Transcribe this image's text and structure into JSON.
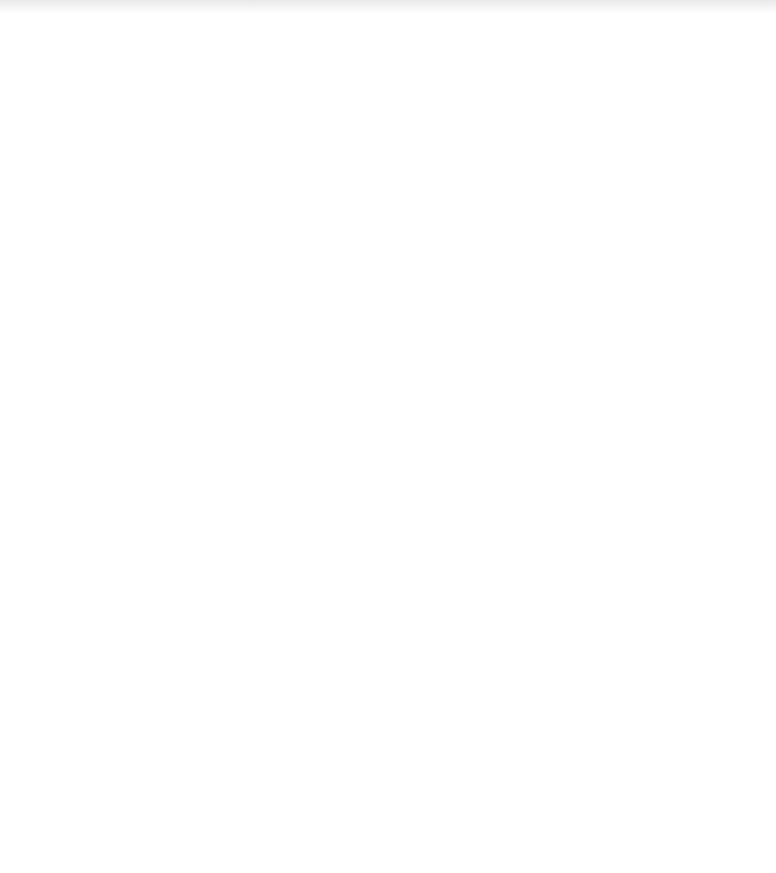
{
  "colors": {
    "background": "#ffffff",
    "wall": "#000000",
    "ray_light": "#8a8a8a",
    "ray_dark": "#1a1a1a",
    "divider": "#555555"
  },
  "figures": {
    "left_corner": {
      "walls": [
        {
          "x1": 41,
          "y1": 60,
          "x2": 41,
          "y2": 397
        },
        {
          "x1": 38,
          "y1": 397,
          "x2": 383,
          "y2": 397
        },
        {
          "x1": 137,
          "y1": 60,
          "x2": 137,
          "y2": 300.5
        },
        {
          "x1": 134,
          "y1": 300.5,
          "x2": 383,
          "y2": 300.5
        }
      ],
      "dividers": [
        {
          "x1": 44,
          "y1": 303,
          "x2": 134,
          "y2": 303
        },
        {
          "x1": 134,
          "y1": 303,
          "x2": 134,
          "y2": 394
        }
      ],
      "rays": [
        {
          "points": "44,60 134,120 44,181 134,243 44,303"
        },
        {
          "points": "134,60 44,120 134,181 44,243 134,303"
        },
        {
          "points": "135,303 195,394 257,303 317,394 375,303 383,315"
        },
        {
          "points": "135,394 195,303 257,394 317,303 375,394 383,382"
        }
      ],
      "corner_lattice": {
        "box": {
          "x": 44,
          "y": 303,
          "w": 90,
          "h": 91
        },
        "back_slash_offsets": [
          -124,
          -89,
          -54,
          -19,
          16,
          51,
          86
        ],
        "slash_offsets": [
          340,
          375,
          410,
          445,
          480,
          515,
          550
        ]
      }
    },
    "right_corner": {
      "walls": [
        {
          "x1": 406,
          "y1": 60,
          "x2": 406,
          "y2": 397
        },
        {
          "x1": 403,
          "y1": 397,
          "x2": 745,
          "y2": 397
        },
        {
          "x1": 480,
          "y1": 60,
          "x2": 480,
          "y2": 325.5
        },
        {
          "x1": 477,
          "y1": 325.5,
          "x2": 745,
          "y2": 325.5
        }
      ],
      "dividers": [
        {
          "x1": 409,
          "y1": 328,
          "x2": 477,
          "y2": 328
        },
        {
          "x1": 477,
          "y1": 328,
          "x2": 477,
          "y2": 394
        }
      ],
      "rays": [
        {
          "points": "409,60 477,128 409,193 477,260 409,327"
        },
        {
          "points": "477,394 545,328 612,394 679,328 745,394"
        }
      ],
      "corner_rays": [
        {
          "points": "428,328 458,394"
        },
        {
          "points": "458,328 477,368"
        },
        {
          "points": "410,349 436,394"
        },
        {
          "points": "410,382 416,394"
        }
      ]
    },
    "lattice": {
      "box": {
        "x": 103,
        "y": 458,
        "w": 577,
        "h": 374
      },
      "top_line": {
        "x1": 103,
        "y1": 458,
        "x2": 680,
        "y2": 458
      },
      "bottom_line": {
        "x1": 103,
        "y1": 832,
        "x2": 680,
        "y2": 832
      },
      "reflection_points_x": [
        152,
        179,
        278,
        305,
        403,
        430,
        529,
        556,
        654,
        679
      ],
      "left_reflection_points_y": [
        508,
        532,
        630,
        655,
        752,
        775
      ],
      "period": 125.5,
      "pair_gap": 27
    }
  }
}
